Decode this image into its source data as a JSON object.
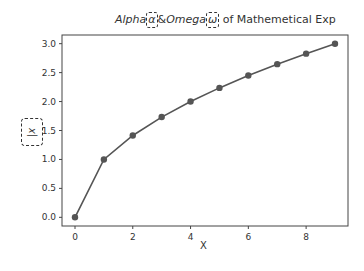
{
  "chart_data": {
    "type": "line",
    "title_parts": {
      "alpha_word": "Alpha",
      "alpha_symbol": "α",
      "amp": "&",
      "omega_word": "Omega",
      "omega_symbol": "ω",
      "suffix": " of Mathemetical Exp"
    },
    "xlabel": "X",
    "ylabel": "|x",
    "x": [
      0,
      1,
      2,
      3,
      4,
      5,
      6,
      7,
      8,
      9
    ],
    "series": [
      {
        "name": "sqrt(x)",
        "values": [
          0.0,
          1.0,
          1.414,
          1.732,
          2.0,
          2.236,
          2.449,
          2.646,
          2.828,
          3.0
        ],
        "color": "#555555",
        "marker": "o"
      }
    ],
    "xticks": [
      "0",
      "2",
      "4",
      "6",
      "8"
    ],
    "yticks": [
      "0.0",
      "0.5",
      "1.0",
      "1.5",
      "2.0",
      "2.5",
      "3.0"
    ],
    "xlim": [
      -0.45,
      9.45
    ],
    "ylim": [
      -0.15,
      3.15
    ],
    "grid": false,
    "legend": null
  }
}
